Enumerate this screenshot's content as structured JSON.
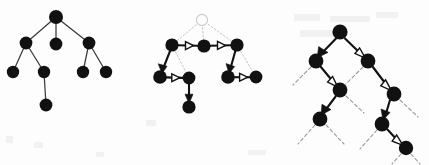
{
  "figure": {
    "background_color": "#fdfdfd",
    "node_color": "#111111",
    "arrow_color": "#111111",
    "dotted_edge_color": "#c2c2c2",
    "dashed_edge_color": "#9a9a9a",
    "width": 429,
    "height": 165,
    "panel_count": 3
  },
  "panels": [
    {
      "id": "panel-1",
      "name": "plain-tree",
      "description": "Undirected tree with solid root and thin plain edges",
      "node_radius": 6.2,
      "nodes": [
        {
          "id": "p1-n0",
          "name": "root",
          "x": 56,
          "y": 17,
          "style": "filled"
        },
        {
          "id": "p1-n1",
          "name": "left-child",
          "x": 26,
          "y": 43,
          "style": "filled"
        },
        {
          "id": "p1-n2",
          "name": "middle-child",
          "x": 56,
          "y": 44,
          "style": "filled"
        },
        {
          "id": "p1-n3",
          "name": "right-child",
          "x": 89,
          "y": 43,
          "style": "filled"
        },
        {
          "id": "p1-n4",
          "name": "left-left",
          "x": 13,
          "y": 72,
          "style": "filled"
        },
        {
          "id": "p1-n5",
          "name": "left-right",
          "x": 44,
          "y": 72,
          "style": "filled"
        },
        {
          "id": "p1-n6",
          "name": "right-left",
          "x": 83,
          "y": 72,
          "style": "filled"
        },
        {
          "id": "p1-n7",
          "name": "right-right",
          "x": 106,
          "y": 72,
          "style": "filled"
        },
        {
          "id": "p1-n8",
          "name": "leaf-bottom",
          "x": 46,
          "y": 105,
          "style": "filled"
        }
      ],
      "edges": [
        {
          "from": "p1-n0",
          "to": "p1-n1",
          "style": "plain"
        },
        {
          "from": "p1-n0",
          "to": "p1-n2",
          "style": "plain"
        },
        {
          "from": "p1-n0",
          "to": "p1-n3",
          "style": "plain"
        },
        {
          "from": "p1-n1",
          "to": "p1-n4",
          "style": "plain"
        },
        {
          "from": "p1-n1",
          "to": "p1-n5",
          "style": "plain"
        },
        {
          "from": "p1-n3",
          "to": "p1-n6",
          "style": "plain"
        },
        {
          "from": "p1-n3",
          "to": "p1-n7",
          "style": "plain"
        },
        {
          "from": "p1-n5",
          "to": "p1-n8",
          "style": "plain"
        }
      ]
    },
    {
      "id": "panel-2",
      "name": "traversal-tree",
      "description": "Same tree with hollow root, dotted tree edges and a directed traversal path",
      "node_radius": 6.2,
      "nodes": [
        {
          "id": "p2-n0",
          "name": "root-hollow",
          "x": 202,
          "y": 20,
          "style": "hollow"
        },
        {
          "id": "p2-n1",
          "name": "left-child",
          "x": 172,
          "y": 45,
          "style": "filled"
        },
        {
          "id": "p2-n2",
          "name": "middle-child",
          "x": 204,
          "y": 46,
          "style": "filled"
        },
        {
          "id": "p2-n3",
          "name": "right-child",
          "x": 237,
          "y": 45,
          "style": "filled"
        },
        {
          "id": "p2-n4",
          "name": "left-left",
          "x": 160,
          "y": 77,
          "style": "filled"
        },
        {
          "id": "p2-n5",
          "name": "left-right",
          "x": 189,
          "y": 78,
          "style": "filled"
        },
        {
          "id": "p2-n6",
          "name": "right-left",
          "x": 228,
          "y": 77,
          "style": "filled"
        },
        {
          "id": "p2-n7",
          "name": "right-right",
          "x": 256,
          "y": 77,
          "style": "filled"
        },
        {
          "id": "p2-n8",
          "name": "leaf-bottom",
          "x": 189,
          "y": 107,
          "style": "filled"
        }
      ],
      "edges": [
        {
          "from": "p2-n0",
          "to": "p2-n1",
          "style": "dotted"
        },
        {
          "from": "p2-n0",
          "to": "p2-n2",
          "style": "dotted"
        },
        {
          "from": "p2-n0",
          "to": "p2-n3",
          "style": "dotted"
        },
        {
          "from": "p2-n1",
          "to": "p2-n5",
          "style": "dotted"
        },
        {
          "from": "p2-n3",
          "to": "p2-n7",
          "style": "dotted"
        }
      ],
      "arrows": [
        {
          "from": "p2-n1",
          "to": "p2-n2",
          "head": "hollow",
          "direction": "right"
        },
        {
          "from": "p2-n2",
          "to": "p2-n3",
          "head": "hollow",
          "direction": "right"
        },
        {
          "from": "p2-n1",
          "to": "p2-n4",
          "head": "solid",
          "direction": "down-left"
        },
        {
          "from": "p2-n4",
          "to": "p2-n5",
          "head": "hollow",
          "direction": "right"
        },
        {
          "from": "p2-n5",
          "to": "p2-n8",
          "head": "solid",
          "direction": "down"
        },
        {
          "from": "p2-n3",
          "to": "p2-n6",
          "head": "solid",
          "direction": "down-left"
        },
        {
          "from": "p2-n6",
          "to": "p2-n7",
          "head": "hollow",
          "direction": "right"
        }
      ]
    },
    {
      "id": "panel-3",
      "name": "zigzag-path-tree",
      "description": "Binary tree with a directed zig-zag path and dashed unexplored stubs",
      "node_radius": 7.0,
      "nodes": [
        {
          "id": "p3-n0",
          "name": "root",
          "x": 340,
          "y": 32,
          "style": "filled"
        },
        {
          "id": "p3-n1",
          "name": "left-child",
          "x": 316,
          "y": 61,
          "style": "filled"
        },
        {
          "id": "p3-n2",
          "name": "right-child",
          "x": 368,
          "y": 61,
          "style": "filled"
        },
        {
          "id": "p3-n3",
          "name": "left-right",
          "x": 340,
          "y": 90,
          "style": "filled"
        },
        {
          "id": "p3-n4",
          "name": "right-right",
          "x": 394,
          "y": 94,
          "style": "filled"
        },
        {
          "id": "p3-n5",
          "name": "left-right-left",
          "x": 320,
          "y": 119,
          "style": "filled"
        },
        {
          "id": "p3-n6",
          "name": "right-right-left",
          "x": 382,
          "y": 124,
          "style": "filled"
        },
        {
          "id": "p3-n7",
          "name": "deep-leaf",
          "x": 406,
          "y": 148,
          "style": "filled"
        }
      ],
      "arrows": [
        {
          "from": "p3-n0",
          "to": "p3-n1",
          "head": "solid",
          "direction": "down-left"
        },
        {
          "from": "p3-n0",
          "to": "p3-n2",
          "head": "hollow",
          "direction": "down-right"
        },
        {
          "from": "p3-n1",
          "to": "p3-n3",
          "head": "hollow",
          "direction": "down-right"
        },
        {
          "from": "p3-n2",
          "to": "p3-n4",
          "head": "hollow",
          "direction": "down-right"
        },
        {
          "from": "p3-n3",
          "to": "p3-n5",
          "head": "solid",
          "direction": "down-left"
        },
        {
          "from": "p3-n4",
          "to": "p3-n6",
          "head": "solid",
          "direction": "down-left"
        },
        {
          "from": "p3-n6",
          "to": "p3-n7",
          "head": "hollow",
          "direction": "down-right"
        }
      ],
      "dashed_stubs": [
        {
          "from": "p3-n1",
          "dx": -22,
          "dy": 20
        },
        {
          "from": "p3-n2",
          "dx": -21,
          "dy": 20
        },
        {
          "from": "p3-n3",
          "dx": 22,
          "dy": 20
        },
        {
          "from": "p3-n4",
          "dx": 21,
          "dy": 20
        },
        {
          "from": "p3-n5",
          "dx": -21,
          "dy": 21
        },
        {
          "from": "p3-n5",
          "dx": 21,
          "dy": 21
        },
        {
          "from": "p3-n6",
          "dx": -21,
          "dy": 21
        },
        {
          "from": "p3-n7",
          "dx": -12,
          "dy": 14
        },
        {
          "from": "p3-n7",
          "dx": 12,
          "dy": 14
        }
      ]
    }
  ]
}
